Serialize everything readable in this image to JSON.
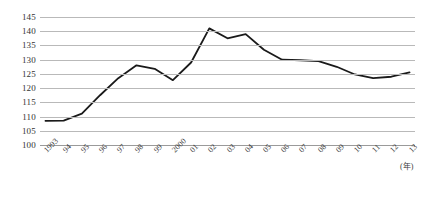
{
  "chart_data": {
    "type": "line",
    "title": "",
    "subtitle": "",
    "xlabel": "(年)",
    "ylabel": "",
    "grid": true,
    "legend": false,
    "ylim": [
      100,
      145
    ],
    "yticks": [
      145,
      140,
      135,
      130,
      125,
      120,
      115,
      110,
      105,
      100
    ],
    "categories": [
      "1993",
      "94",
      "95",
      "96",
      "97",
      "98",
      "99",
      "2000",
      "01",
      "02",
      "03",
      "04",
      "05",
      "06",
      "07",
      "08",
      "09",
      "10",
      "11",
      "12",
      "13"
    ],
    "x": [
      1993,
      1994,
      1995,
      1996,
      1997,
      1998,
      1999,
      2000,
      2001,
      2002,
      2003,
      2004,
      2005,
      2006,
      2007,
      2008,
      2009,
      2010,
      2011,
      2012,
      2013
    ],
    "values": [
      108.5,
      108.6,
      111.0,
      117.5,
      123.5,
      128.0,
      126.8,
      122.8,
      129.0,
      141.0,
      137.5,
      139.0,
      133.5,
      130.0,
      129.8,
      129.5,
      127.5,
      124.8,
      123.5,
      124.0,
      125.5
    ],
    "series": [
      {
        "name": "",
        "color": "#1a1a1a",
        "values": [
          108.5,
          108.6,
          111.0,
          117.5,
          123.5,
          128.0,
          126.8,
          122.8,
          129.0,
          141.0,
          137.5,
          139.0,
          133.5,
          130.0,
          129.8,
          129.5,
          127.5,
          124.8,
          123.5,
          124.0,
          125.5
        ]
      }
    ]
  },
  "axis": {
    "unit_label": "(年)",
    "ytick_labels": [
      "145",
      "140",
      "135",
      "130",
      "125",
      "120",
      "115",
      "110",
      "105",
      "100"
    ],
    "xtick_labels": [
      "1993",
      "94",
      "95",
      "96",
      "97",
      "98",
      "99",
      "2000",
      "01",
      "02",
      "03",
      "04",
      "05",
      "06",
      "07",
      "08",
      "09",
      "10",
      "11",
      "12",
      "13"
    ]
  },
  "style": {
    "line_color": "#1a1a1a",
    "grid_color": "#b9b9b9",
    "background": "#ffffff",
    "text_color": "#333333"
  }
}
